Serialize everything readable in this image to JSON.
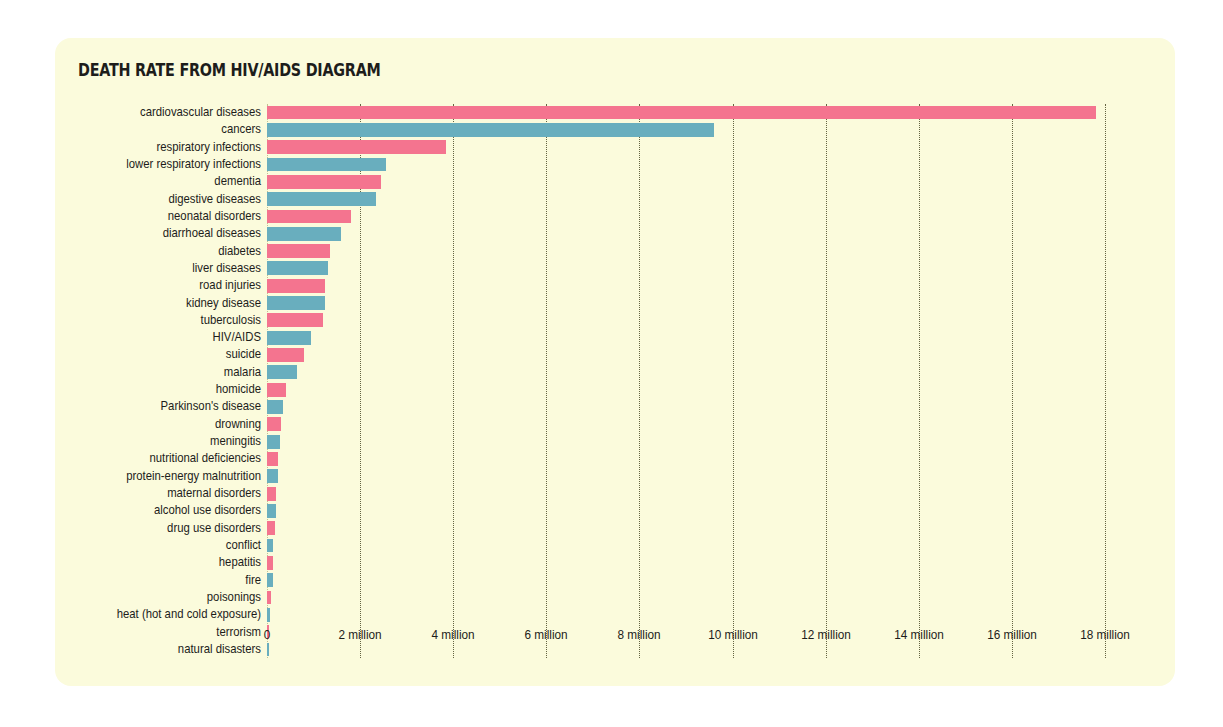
{
  "panel": {
    "background_color": "#fbfbdc",
    "page_background_color": "#ffffff"
  },
  "header": {
    "title": "DEATH RATE FROM HIV/AIDS DIAGRAM"
  },
  "colors": {
    "pink": "#f4748f",
    "teal": "#69aebe",
    "text": "#1d1d1b",
    "gridline": "#5c5c3a"
  },
  "chart_data": {
    "type": "bar",
    "orientation": "horizontal",
    "title": "DEATH RATE FROM HIV/AIDS DIAGRAM",
    "xlabel": "",
    "ylabel": "",
    "xlim": [
      0,
      19000000
    ],
    "grid": true,
    "legend": "none",
    "xticks": [
      0,
      2000000,
      4000000,
      6000000,
      8000000,
      10000000,
      12000000,
      14000000,
      16000000,
      18000000
    ],
    "xtick_labels": [
      "0",
      "2 million",
      "4 million",
      "6 million",
      "8 million",
      "10 million",
      "12 million",
      "14 million",
      "16 million",
      "18 million"
    ],
    "categories": [
      "cardiovascular diseases",
      "cancers",
      "respiratory infections",
      "lower respiratory infections",
      "dementia",
      "digestive diseases",
      "neonatal disorders",
      "diarrhoeal diseases",
      "diabetes",
      "liver diseases",
      "road injuries",
      "kidney disease",
      "tuberculosis",
      "HIV/AIDS",
      "suicide",
      "malaria",
      "homicide",
      "Parkinson's disease",
      "drowning",
      "meningitis",
      "nutritional deficiencies",
      "protein-energy malnutrition",
      "maternal disorders",
      "alcohol use disorders",
      "drug use disorders",
      "conflict",
      "hepatitis",
      "fire",
      "poisonings",
      "heat (hot and cold exposure)",
      "terrorism",
      "natural disasters"
    ],
    "values": [
      17800000,
      9600000,
      3850000,
      2550000,
      2450000,
      2350000,
      1800000,
      1600000,
      1350000,
      1300000,
      1250000,
      1250000,
      1200000,
      950000,
      800000,
      650000,
      400000,
      340000,
      300000,
      290000,
      240000,
      230000,
      200000,
      190000,
      170000,
      130000,
      130000,
      120000,
      85000,
      55000,
      30000,
      15000
    ],
    "bar_colors": [
      "pink",
      "teal",
      "pink",
      "teal",
      "pink",
      "teal",
      "pink",
      "teal",
      "pink",
      "teal",
      "pink",
      "teal",
      "pink",
      "teal",
      "pink",
      "teal",
      "pink",
      "teal",
      "pink",
      "teal",
      "pink",
      "teal",
      "pink",
      "teal",
      "pink",
      "teal",
      "pink",
      "teal",
      "pink",
      "teal",
      "pink",
      "teal"
    ]
  },
  "layout": {
    "plot_left_px": 212,
    "plot_top_px": 66,
    "row_pitch_px": 17.32,
    "bar_height_px": 13.9,
    "px_per_million": 46.55
  }
}
